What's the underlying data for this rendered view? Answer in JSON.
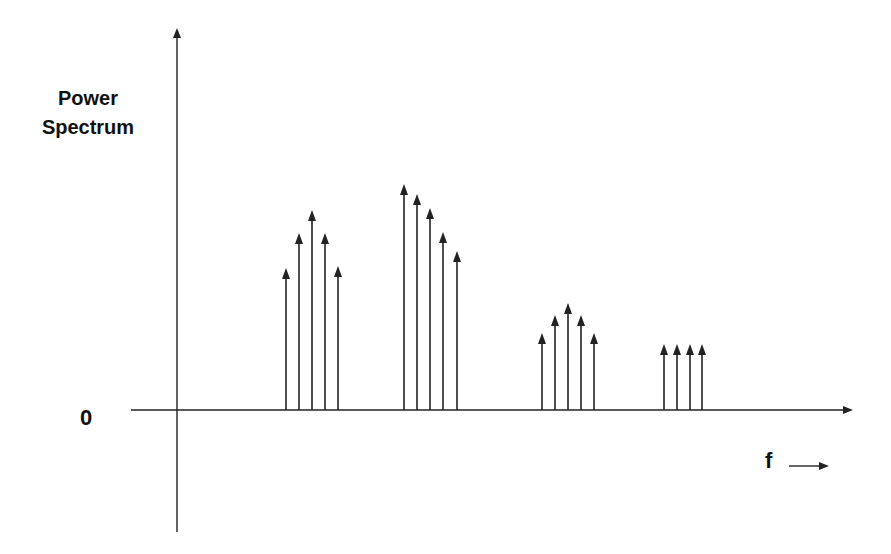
{
  "diagram": {
    "y_label_line1": "Power",
    "y_label_line2": "Spectrum",
    "origin_label": "0",
    "x_label": "f",
    "line_color": "#222222"
  },
  "chart_data": {
    "type": "stem",
    "title": "",
    "xlabel": "f",
    "ylabel": "Power Spectrum",
    "origin": "0",
    "groups": [
      {
        "name": "group-1",
        "x": [
          286,
          299,
          312,
          325,
          338
        ],
        "tip_y": [
          268,
          233,
          210,
          233,
          266
        ]
      },
      {
        "name": "group-2",
        "x": [
          404,
          417,
          430,
          443,
          457
        ],
        "tip_y": [
          184,
          194,
          208,
          232,
          251
        ]
      },
      {
        "name": "group-3",
        "x": [
          542,
          555,
          568,
          581,
          594
        ],
        "tip_y": [
          333,
          315,
          303,
          315,
          333
        ]
      },
      {
        "name": "group-4",
        "x": [
          664,
          677,
          690,
          702
        ],
        "tip_y": [
          344,
          344,
          344,
          344
        ]
      }
    ],
    "axes": {
      "x_axis": {
        "y": 410,
        "x_start": 131,
        "x_end": 853
      },
      "y_axis": {
        "x": 177,
        "y_top": 28,
        "y_bottom": 532
      }
    },
    "grid": false,
    "legend": null
  }
}
